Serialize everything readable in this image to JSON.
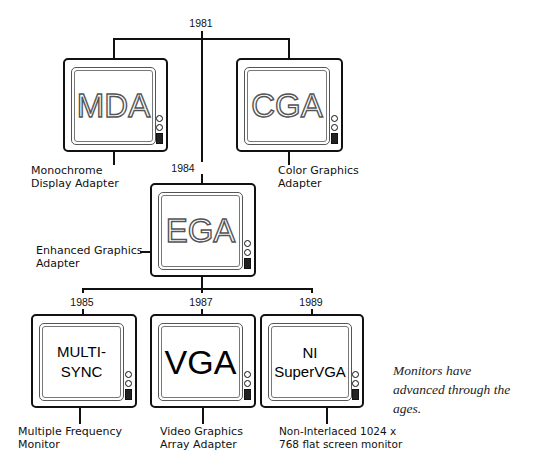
{
  "years": {
    "root": "1981",
    "ega": "1984",
    "multisync": "1985",
    "vga": "1987",
    "nisvga": "1989"
  },
  "monitors": {
    "mda": {
      "screen_text": "MDA",
      "label_line1": "Monochrome",
      "label_line2": "Display Adapter"
    },
    "cga": {
      "screen_text": "CGA",
      "label_line1": "Color Graphics",
      "label_line2": "Adapter"
    },
    "ega": {
      "screen_text": "EGA",
      "label_line1": "Enhanced Graphics",
      "label_line2": "Adapter"
    },
    "multisync": {
      "screen_line1": "MULTI-",
      "screen_line2": "SYNC",
      "label_line1": "Multiple Frequency",
      "label_line2": "Monitor"
    },
    "vga": {
      "screen_text": "VGA",
      "label_line1": "Video Graphics",
      "label_line2": "Array Adapter"
    },
    "nisvga": {
      "screen_line1": "NI",
      "screen_line2": "SuperVGA",
      "label_line1": "Non-Interlaced 1024 x",
      "label_line2": "768 flat screen monitor"
    }
  },
  "caption": {
    "line1": "Monitors have",
    "line2": "advanced through the",
    "line3": "ages."
  },
  "colors": {
    "ink": "#111111",
    "screen_text_dotted": "#555555",
    "background": "#ffffff"
  }
}
